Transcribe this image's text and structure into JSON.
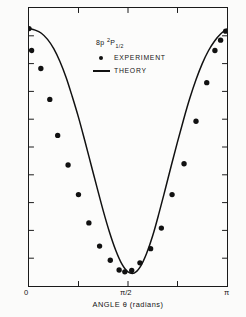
{
  "chart_data": {
    "type": "line",
    "title": "",
    "xlabel": "ANGLE θ (radians)",
    "ylabel": "PHOTOELECTRON SIGNAL (arbitrary units)",
    "xlim": [
      0,
      3.14159
    ],
    "ylim": [
      0,
      1.08
    ],
    "grid": false,
    "xtick_labels": [
      "0",
      "π/2",
      "π"
    ],
    "xtick_values": [
      0,
      1.5708,
      3.14159
    ],
    "ytick_count": 11,
    "ytick_labels": [],
    "legend_position": "top-center",
    "legend_title": "8p ²P₁₂",
    "legend_title_parts": {
      "level": "8p",
      "multiplicity": "2",
      "term": "P",
      "j": "1/2"
    },
    "series": [
      {
        "name": "THEORY",
        "type": "line",
        "style": "solid",
        "color": "#111111",
        "description": "cos^2 theta angular distribution fitted through experimental points",
        "x": [
          0.0,
          0.0982,
          0.1963,
          0.2945,
          0.3927,
          0.4909,
          0.589,
          0.6872,
          0.7854,
          0.8836,
          0.9817,
          1.0799,
          1.1781,
          1.2763,
          1.3744,
          1.4726,
          1.5708,
          1.669,
          1.7671,
          1.8653,
          1.9635,
          2.0617,
          2.1598,
          2.258,
          2.3562,
          2.4544,
          2.5525,
          2.6507,
          2.7489,
          2.8471,
          2.9452,
          3.0434,
          3.14159
        ],
        "y": [
          1.0,
          0.994,
          0.982,
          0.958,
          0.922,
          0.872,
          0.81,
          0.735,
          0.655,
          0.566,
          0.474,
          0.382,
          0.292,
          0.21,
          0.14,
          0.086,
          0.055,
          0.05,
          0.075,
          0.126,
          0.196,
          0.282,
          0.374,
          0.468,
          0.56,
          0.648,
          0.73,
          0.802,
          0.864,
          0.914,
          0.952,
          0.98,
          0.998
        ]
      },
      {
        "name": "EXPERIMENT",
        "type": "scatter",
        "marker": "filled-circle",
        "color": "#111111",
        "x": [
          0.0,
          0.041,
          0.188,
          0.33,
          0.455,
          0.62,
          0.785,
          0.95,
          1.12,
          1.29,
          1.43,
          1.52,
          1.63,
          1.76,
          1.93,
          2.1,
          2.27,
          2.46,
          2.65,
          2.82,
          2.95,
          3.04,
          3.12
        ],
        "y": [
          1.0,
          0.915,
          0.845,
          0.725,
          0.585,
          0.47,
          0.355,
          0.245,
          0.155,
          0.1,
          0.062,
          0.055,
          0.06,
          0.09,
          0.145,
          0.225,
          0.355,
          0.475,
          0.64,
          0.79,
          0.915,
          0.955,
          0.99
        ]
      }
    ]
  },
  "legend": {
    "title_prefix": "8p",
    "title_sup": "2",
    "title_term": "P",
    "title_sub": "1/2",
    "entries": [
      {
        "label": "EXPERIMENT",
        "key": "filled-circle-marker"
      },
      {
        "label": "THEORY",
        "key": "solid-line-marker"
      }
    ]
  },
  "axes": {
    "x_title": "ANGLE θ (radians)",
    "y_title": "PHOTOELECTRON SIGNAL (arbitrary units)",
    "x_tick_0": "0",
    "x_tick_half": "π/2",
    "x_tick_pi": "π"
  }
}
